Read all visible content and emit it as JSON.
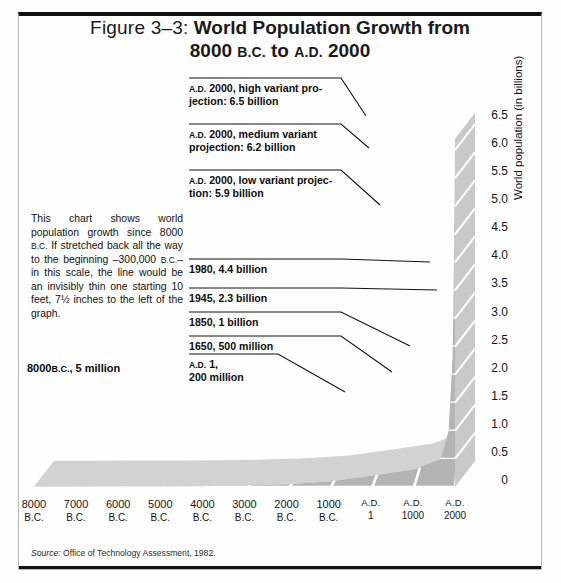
{
  "figure": {
    "label": "Figure 3–3:",
    "title_line1": "World Population Growth from",
    "title_line2_a": "8000",
    "title_line2_bc": "B.C.",
    "title_line2_b": "to",
    "title_line2_ad": "A.D.",
    "title_line2_c": "2000",
    "source": "Office of Technology Assessment, 1982.",
    "source_prefix": "Source:"
  },
  "blurb": {
    "text_a": "This chart shows world population growth since 8000 ",
    "sc1": "B.C.",
    "text_b": " If stretched back all the way to the beginning –300,000 ",
    "sc2": "B.C.",
    "text_c": "–in this scale, the line would be an invisibly thin one starting 10 feet, 7½ inches to the left of the graph."
  },
  "chart_data": {
    "type": "area",
    "title": "World Population Growth from 8000 B.C. to A.D. 2000",
    "xlabel": "",
    "ylabel": "World population (in billions)",
    "ylim": [
      0,
      6.75
    ],
    "grid": true,
    "legend_position": "none",
    "x_tick_labels": [
      {
        "top": "8000",
        "bottom": "B.C."
      },
      {
        "top": "7000",
        "bottom": "B.C."
      },
      {
        "top": "6000",
        "bottom": "B.C."
      },
      {
        "top": "5000",
        "bottom": "B.C."
      },
      {
        "top": "4000",
        "bottom": "B.C."
      },
      {
        "top": "3000",
        "bottom": "B.C."
      },
      {
        "top": "2000",
        "bottom": "B.C."
      },
      {
        "top": "1000",
        "bottom": "B.C."
      },
      {
        "top": "A.D.",
        "bottom": "1"
      },
      {
        "top": "A.D.",
        "bottom": "1000"
      },
      {
        "top": "A.D.",
        "bottom": "2000"
      }
    ],
    "y_tick_labels": [
      "6.5",
      "6.0",
      "5.5",
      "5.0",
      "4.5",
      "4.0",
      "3.5",
      "3.0",
      "2.5",
      "2.0",
      "1.5",
      "1.0",
      "0.5",
      "0"
    ],
    "y_tick_values": [
      6.5,
      6.0,
      5.5,
      5.0,
      4.5,
      4.0,
      3.5,
      3.0,
      2.5,
      2.0,
      1.5,
      1.0,
      0.5,
      0
    ],
    "series": [
      {
        "name": "World population",
        "x_years": [
          -8000,
          -7000,
          -6000,
          -5000,
          -4000,
          -3000,
          -2000,
          -1000,
          1,
          1000,
          1650,
          1850,
          1945,
          1980,
          2000
        ],
        "values_billions": [
          0.005,
          0.006,
          0.007,
          0.01,
          0.015,
          0.025,
          0.05,
          0.1,
          0.2,
          0.31,
          0.5,
          1.0,
          2.3,
          4.4,
          6.2
        ]
      }
    ],
    "annotations": [
      {
        "id": "high",
        "sc": "A.D.",
        "text": "2000, high variant projection: 6.5 billion",
        "value": 6.5
      },
      {
        "id": "medium",
        "sc": "A.D.",
        "text": "2000, medium variant projection: 6.2 billion",
        "value": 6.2
      },
      {
        "id": "low",
        "sc": "A.D.",
        "text": "2000, low variant projection: 5.9 billion",
        "value": 5.9
      },
      {
        "id": "y1980",
        "sc": "",
        "text": "1980, 4.4 billion",
        "value": 4.4
      },
      {
        "id": "y1945",
        "sc": "",
        "text": "1945, 2.3 billion",
        "value": 2.3
      },
      {
        "id": "y1850",
        "sc": "",
        "text": "1850, 1 billion",
        "value": 1.0
      },
      {
        "id": "y1650",
        "sc": "",
        "text": "1650, 500 million",
        "value": 0.5
      },
      {
        "id": "ad1",
        "sc": "A.D.",
        "text": "1, 200 million",
        "value": 0.2
      },
      {
        "id": "start",
        "sc": "B.C.",
        "text": "8000 B.C., 5 million",
        "value": 0.005
      }
    ],
    "colors": {
      "band_dark": "#b4b4b4",
      "band_mid": "#c6c6c6",
      "band_light": "#dcdcdc",
      "band_lightest": "#ececec",
      "gridline": "#ffffff",
      "ink": "#111111"
    }
  },
  "notes": {
    "high_sc": "A.D.",
    "high_l1": "2000, high variant pro-",
    "high_l2": "jection: 6.5 billion",
    "med_sc": "A.D.",
    "med_l1": "2000, medium variant",
    "med_l2": "projection: 6.2 billion",
    "low_sc": "A.D.",
    "low_l1": "2000, low variant projec-",
    "low_l2": "tion: 5.9 billion",
    "n1980": "1980, 4.4 billion",
    "n1945": "1945, 2.3 billion",
    "n1850": "1850, 1 billion",
    "n1650": "1650, 500 million",
    "ad1_sc": "A.D.",
    "ad1_l1": "1,",
    "ad1_l2": "200 million",
    "start_a": "8000",
    "start_sc": "B.C.",
    "start_b": ", 5 million"
  }
}
